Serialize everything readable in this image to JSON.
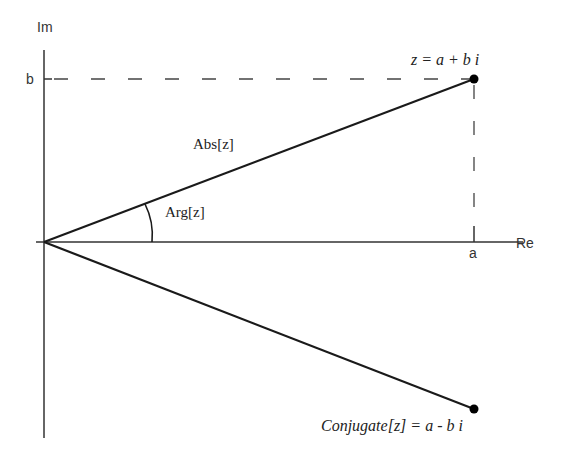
{
  "diagram": {
    "axes": {
      "imaginary_label": "Im",
      "real_label": "Re",
      "b_tick": "b",
      "a_tick": "a"
    },
    "labels": {
      "z_point": "z = a + b i",
      "conjugate_point": "Conjugate[z] = a - b i",
      "abs": "Abs[z]",
      "arg": "Arg[z]"
    },
    "colors": {
      "line": "#1a1a1a",
      "axis": "#333333",
      "dashed": "#444444",
      "point": "#000000"
    }
  }
}
